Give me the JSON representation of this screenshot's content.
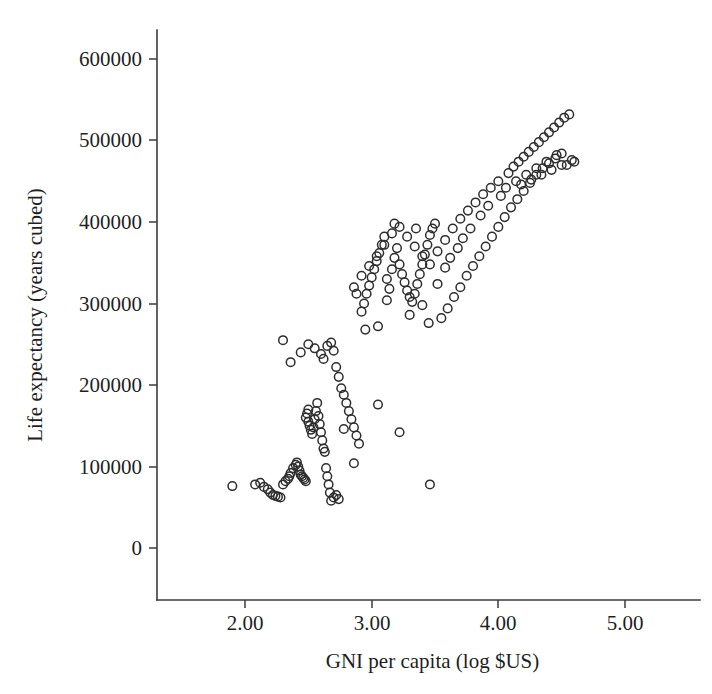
{
  "figure": {
    "width": 712,
    "height": 694,
    "background": "#ffffff",
    "marker_color": "#2e2e2e",
    "axis_color": "#3b3b3b",
    "text_color": "#1f1f1f"
  },
  "geometry": {
    "axis_x_px": 157,
    "axis_y_px": 600,
    "plot_right_px": 700,
    "plot_top_px": 30,
    "x_tick_px": [
      245,
      372,
      498,
      625
    ],
    "y_tick_px": [
      59,
      140,
      222,
      304,
      385,
      467,
      548
    ],
    "tick_len_px": 8
  },
  "chart_data": {
    "type": "scatter",
    "title": "",
    "xlabel": "GNI per capita (log $US)",
    "ylabel": "Life expectancy (years cubed)",
    "xticklabels": [
      "2.00",
      "3.00",
      "4.00",
      "5.00"
    ],
    "xtickvalues": [
      2.0,
      3.0,
      4.0,
      5.0
    ],
    "yticklabels": [
      "600000",
      "500000",
      "400000",
      "300000",
      "200000",
      "100000",
      "0"
    ],
    "ytickvalues": [
      600000,
      500000,
      400000,
      300000,
      200000,
      100000,
      0
    ],
    "xlim": [
      1.35,
      5.3
    ],
    "ylim": [
      0,
      640000
    ],
    "grid": false,
    "legend": null,
    "marker": "open-circle",
    "marker_radius_px": 4.3,
    "n_points": 190,
    "x": [
      1.9,
      2.08,
      2.12,
      2.15,
      2.18,
      2.2,
      2.22,
      2.24,
      2.26,
      2.28,
      2.3,
      2.32,
      2.34,
      2.35,
      2.36,
      2.38,
      2.4,
      2.41,
      2.42,
      2.43,
      2.44,
      2.45,
      2.46,
      2.47,
      2.48,
      2.48,
      2.49,
      2.5,
      2.5,
      2.51,
      2.52,
      2.53,
      2.54,
      2.55,
      2.56,
      2.57,
      2.58,
      2.59,
      2.6,
      2.61,
      2.62,
      2.63,
      2.64,
      2.65,
      2.66,
      2.67,
      2.68,
      2.7,
      2.72,
      2.74,
      2.3,
      2.36,
      2.44,
      2.5,
      2.55,
      2.6,
      2.62,
      2.65,
      2.68,
      2.7,
      2.72,
      2.74,
      2.76,
      2.78,
      2.8,
      2.82,
      2.84,
      2.86,
      2.88,
      2.9,
      2.92,
      2.94,
      2.96,
      2.98,
      3.0,
      3.02,
      3.04,
      3.06,
      3.08,
      3.1,
      3.12,
      3.14,
      3.16,
      3.18,
      3.2,
      3.22,
      3.24,
      3.26,
      3.28,
      3.3,
      3.32,
      3.34,
      3.36,
      3.38,
      3.4,
      3.42,
      3.44,
      3.46,
      3.48,
      3.5,
      2.86,
      2.92,
      2.98,
      3.04,
      3.1,
      3.16,
      3.22,
      3.28,
      3.34,
      3.4,
      3.46,
      3.52,
      3.58,
      3.64,
      3.7,
      3.76,
      3.82,
      3.88,
      3.94,
      4.0,
      3.55,
      3.6,
      3.65,
      3.7,
      3.75,
      3.8,
      3.85,
      3.9,
      3.95,
      4.0,
      4.05,
      4.1,
      4.15,
      4.2,
      4.25,
      4.3,
      4.35,
      4.4,
      4.45,
      4.5,
      4.08,
      4.12,
      4.16,
      4.2,
      4.24,
      4.28,
      4.32,
      4.36,
      4.4,
      4.44,
      4.48,
      4.52,
      4.56,
      4.6,
      4.18,
      4.26,
      4.34,
      4.42,
      4.5,
      4.58,
      3.52,
      3.18,
      3.35,
      3.45,
      2.88,
      3.05,
      3.3,
      2.95,
      3.12,
      3.4,
      3.05,
      2.78,
      2.86,
      3.22,
      3.46,
      3.58,
      3.62,
      3.68,
      3.72,
      3.78,
      4.06,
      4.14,
      4.22,
      4.3,
      4.38,
      4.46,
      4.54,
      3.86,
      3.92,
      4.02
    ],
    "y": [
      76000,
      78000,
      80000,
      75000,
      72000,
      68000,
      65000,
      64000,
      63000,
      62000,
      78000,
      82000,
      85000,
      88000,
      92000,
      98000,
      102000,
      105000,
      100000,
      95000,
      90000,
      88000,
      86000,
      84000,
      82000,
      160000,
      165000,
      170000,
      155000,
      150000,
      145000,
      140000,
      148000,
      158000,
      168000,
      178000,
      162000,
      152000,
      142000,
      132000,
      122000,
      118000,
      98000,
      88000,
      78000,
      68000,
      58000,
      62000,
      65000,
      60000,
      255000,
      228000,
      240000,
      250000,
      245000,
      238000,
      232000,
      248000,
      252000,
      242000,
      222000,
      210000,
      196000,
      188000,
      178000,
      168000,
      158000,
      148000,
      138000,
      128000,
      290000,
      300000,
      312000,
      322000,
      332000,
      342000,
      352000,
      362000,
      372000,
      382000,
      330000,
      318000,
      342000,
      356000,
      368000,
      348000,
      336000,
      326000,
      316000,
      308000,
      302000,
      312000,
      324000,
      336000,
      348000,
      360000,
      372000,
      384000,
      392000,
      398000,
      320000,
      334000,
      346000,
      358000,
      372000,
      386000,
      394000,
      382000,
      370000,
      358000,
      348000,
      364000,
      378000,
      392000,
      404000,
      414000,
      424000,
      434000,
      442000,
      450000,
      282000,
      294000,
      308000,
      320000,
      334000,
      346000,
      358000,
      370000,
      382000,
      394000,
      406000,
      418000,
      428000,
      438000,
      448000,
      458000,
      466000,
      472000,
      478000,
      484000,
      460000,
      468000,
      474000,
      480000,
      486000,
      492000,
      498000,
      504000,
      510000,
      516000,
      522000,
      528000,
      532000,
      474000,
      446000,
      452000,
      458000,
      464000,
      470000,
      476000,
      324000,
      398000,
      392000,
      276000,
      312000,
      272000,
      286000,
      268000,
      304000,
      298000,
      176000,
      146000,
      104000,
      142000,
      78000,
      344000,
      356000,
      368000,
      380000,
      392000,
      442000,
      450000,
      458000,
      466000,
      474000,
      482000,
      470000,
      408000,
      420000,
      432000
    ]
  }
}
